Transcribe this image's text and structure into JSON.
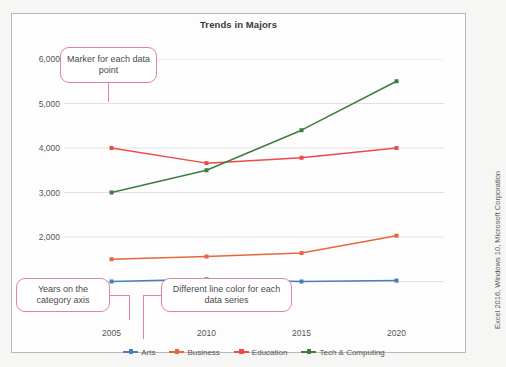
{
  "credit": "Excel 2016, Windows 10, Microsoft Corporation",
  "chart_data": {
    "type": "line",
    "title": "Trends in Majors",
    "xlabel": "",
    "ylabel": "",
    "categories": [
      "2005",
      "2010",
      "2015",
      "2020"
    ],
    "x": [
      2005,
      2010,
      2015,
      2020
    ],
    "series": [
      {
        "name": "Arts",
        "color": "#4a7ebb",
        "values": [
          1000,
          1050,
          1000,
          1020
        ]
      },
      {
        "name": "Business",
        "color": "#e8663d",
        "values": [
          1500,
          1560,
          1640,
          2030
        ]
      },
      {
        "name": "Education",
        "color": "#e84c4c",
        "values": [
          4000,
          3660,
          3780,
          4000
        ]
      },
      {
        "name": "Tech & Computing",
        "color": "#3f7d3f",
        "values": [
          3000,
          3500,
          4400,
          5500
        ]
      }
    ],
    "ylim": [
      0,
      6000
    ],
    "yticks": [
      1000,
      2000,
      3000,
      4000,
      5000,
      6000
    ],
    "ytick_labels": [
      "1,000",
      "2,000",
      "3,000",
      "4,000",
      "5,000",
      "6,000"
    ],
    "grid": true,
    "legend_position": "bottom",
    "marker": "square"
  },
  "callouts": [
    {
      "id": "marker",
      "text": "Marker for each data point"
    },
    {
      "id": "years",
      "text": "Years on the category axis"
    },
    {
      "id": "linecolor",
      "text": "Different line color for each data series"
    }
  ]
}
